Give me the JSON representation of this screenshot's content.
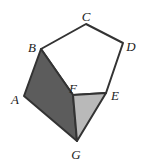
{
  "figure": {
    "colors": {
      "stroke": "#333333",
      "dark_face": "#5c5c5c",
      "light_face": "#b9b9b9",
      "top_face": "#ffffff"
    },
    "vertices": {
      "A": [
        24,
        96
      ],
      "B": [
        41,
        49
      ],
      "C": [
        86,
        24
      ],
      "D": [
        123,
        43
      ],
      "E": [
        106,
        93
      ],
      "F": [
        73,
        95
      ],
      "G": [
        77,
        141
      ]
    },
    "faces": [
      {
        "name": "top-face",
        "points": [
          "B",
          "C",
          "D",
          "E",
          "F"
        ],
        "fill": "white"
      },
      {
        "name": "dark-face",
        "points": [
          "A",
          "B",
          "F",
          "G"
        ],
        "fill": "dark gray"
      },
      {
        "name": "light-face",
        "points": [
          "F",
          "E",
          "G"
        ],
        "fill": "light gray"
      }
    ],
    "labels": {
      "A": "A",
      "B": "B",
      "C": "C",
      "D": "D",
      "E": "E",
      "F": "F",
      "G": "G"
    }
  }
}
